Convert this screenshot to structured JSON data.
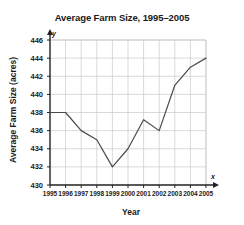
{
  "chart_data": {
    "type": "line",
    "title": "Average Farm Size, 1995–2005",
    "xlabel": "Year",
    "ylabel": "Average Farm Size (acres)",
    "categories": [
      "1995",
      "1996",
      "1997",
      "1998",
      "1999",
      "2000",
      "2001",
      "2002",
      "2003",
      "2004",
      "2005"
    ],
    "x": [
      1995,
      1996,
      1997,
      1998,
      1999,
      2000,
      2001,
      2002,
      2003,
      2004,
      2005
    ],
    "values": [
      438,
      438,
      436,
      435,
      432,
      434,
      437.2,
      436,
      441,
      443,
      444
    ],
    "series": [
      {
        "name": "Average Farm Size",
        "values": [
          438,
          438,
          436,
          435,
          432,
          434,
          437.2,
          436,
          441,
          443,
          444
        ]
      }
    ],
    "ylim": [
      430,
      446
    ],
    "xlim": [
      1995,
      2005
    ],
    "yticks": [
      430,
      432,
      434,
      436,
      438,
      440,
      442,
      444,
      446
    ],
    "ytick_labels": [
      "430",
      "432",
      "434",
      "436",
      "438",
      "440",
      "442",
      "444",
      "446"
    ],
    "xtick_labels": [
      "1995",
      "1996",
      "1997",
      "1998",
      "1999",
      "2000",
      "2001",
      "2002",
      "2003",
      "2004",
      "2005"
    ],
    "grid": true,
    "legend": "none",
    "line_color": "#4a4a4a",
    "grid_color": "#c9c9c9",
    "axis_color": "#222222",
    "axis_letters": {
      "y": "y",
      "x": "x"
    }
  }
}
